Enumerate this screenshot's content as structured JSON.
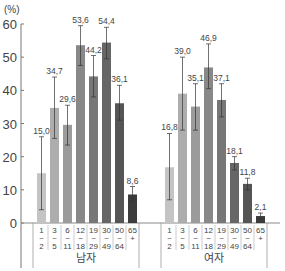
{
  "chart_data": {
    "type": "bar",
    "title": "",
    "ylabel": "(%)",
    "xlabel": "",
    "ylim": [
      0,
      60
    ],
    "yticks": [
      0,
      10,
      20,
      30,
      40,
      50,
      60
    ],
    "grid": false,
    "error_bars": true,
    "categories": [
      "1~2",
      "3~5",
      "6~11",
      "12~18",
      "19~29",
      "30~49",
      "50~64",
      "65+"
    ],
    "category_labels": [
      [
        "1",
        "~",
        "2"
      ],
      [
        "3",
        "~",
        "5"
      ],
      [
        "6",
        "~",
        "11"
      ],
      [
        "12",
        "~",
        "18"
      ],
      [
        "19",
        "~",
        "29"
      ],
      [
        "30",
        "~",
        "49"
      ],
      [
        "50",
        "~",
        "64"
      ],
      [
        "65",
        "+",
        ""
      ]
    ],
    "groups": [
      {
        "name": "남자",
        "values": [
          15.0,
          34.7,
          29.6,
          53.6,
          44.2,
          54.4,
          36.1,
          8.6
        ],
        "labels": [
          "15,0",
          "34,7",
          "29,6",
          "53,6",
          "44,2",
          "54,4",
          "36,1",
          "8,6"
        ],
        "err_low": [
          4.0,
          25.5,
          23.5,
          47.5,
          38.0,
          49.5,
          31.0,
          6.5
        ],
        "err_high": [
          26.0,
          44.0,
          35.5,
          59.5,
          50.5,
          59.0,
          41.5,
          11.0
        ]
      },
      {
        "name": "여자",
        "values": [
          16.8,
          39.0,
          35.1,
          46.9,
          37.1,
          18.1,
          11.8,
          2.1
        ],
        "labels": [
          "16,8",
          "39,0",
          "35,1",
          "46,9",
          "37,1",
          "18,1",
          "11,8",
          "2,1"
        ],
        "err_low": [
          7.0,
          28.0,
          28.0,
          40.5,
          32.0,
          16.0,
          10.0,
          1.2
        ],
        "err_high": [
          27.0,
          50.0,
          42.0,
          54.0,
          42.0,
          20.0,
          13.5,
          3.0
        ]
      }
    ],
    "colors": [
      "#c4c4c4",
      "#adadad",
      "#9b9b9b",
      "#888888",
      "#777777",
      "#666666",
      "#555555",
      "#3c3c3c"
    ]
  }
}
